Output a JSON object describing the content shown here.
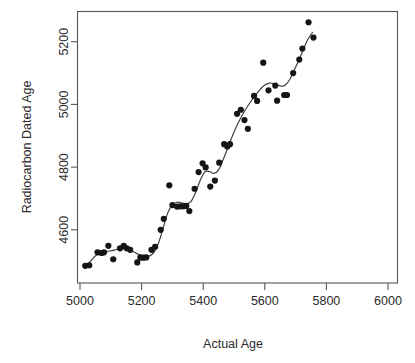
{
  "chart_data": {
    "type": "scatter",
    "title": "",
    "xlabel": "Actual Age",
    "ylabel": "Radiocarbon Dated Age",
    "xlim": [
      4995,
      6000
    ],
    "ylim": [
      4470,
      5285
    ],
    "grid": false,
    "legend": null,
    "xticks": [
      5000,
      5200,
      5400,
      5600,
      5800,
      6000
    ],
    "xticklabels": [
      "5000",
      "5200",
      "5400",
      "5600",
      "5800",
      "6000"
    ],
    "yticks": [
      4600,
      4800,
      5000,
      5200
    ],
    "yticklabels": [
      "4600",
      "4800",
      "5000",
      "5200"
    ],
    "marker": "filled-circle",
    "marker_color": "#151515",
    "curve_color": "#3a3a3a",
    "curve_label": "smoothed fit",
    "points": [
      {
        "x": 5017,
        "y": 4485
      },
      {
        "x": 5030,
        "y": 4487
      },
      {
        "x": 5057,
        "y": 4528
      },
      {
        "x": 5070,
        "y": 4526
      },
      {
        "x": 5078,
        "y": 4528
      },
      {
        "x": 5092,
        "y": 4549
      },
      {
        "x": 5108,
        "y": 4506
      },
      {
        "x": 5130,
        "y": 4541
      },
      {
        "x": 5142,
        "y": 4549
      },
      {
        "x": 5152,
        "y": 4541
      },
      {
        "x": 5163,
        "y": 4536
      },
      {
        "x": 5186,
        "y": 4496
      },
      {
        "x": 5196,
        "y": 4512
      },
      {
        "x": 5205,
        "y": 4511
      },
      {
        "x": 5215,
        "y": 4512
      },
      {
        "x": 5232,
        "y": 4536
      },
      {
        "x": 5244,
        "y": 4546
      },
      {
        "x": 5262,
        "y": 4600
      },
      {
        "x": 5272,
        "y": 4635
      },
      {
        "x": 5290,
        "y": 4742
      },
      {
        "x": 5300,
        "y": 4679
      },
      {
        "x": 5315,
        "y": 4674
      },
      {
        "x": 5325,
        "y": 4675
      },
      {
        "x": 5335,
        "y": 4675
      },
      {
        "x": 5345,
        "y": 4676
      },
      {
        "x": 5355,
        "y": 4660
      },
      {
        "x": 5372,
        "y": 4731
      },
      {
        "x": 5385,
        "y": 4784
      },
      {
        "x": 5398,
        "y": 4812
      },
      {
        "x": 5408,
        "y": 4799
      },
      {
        "x": 5423,
        "y": 4738
      },
      {
        "x": 5438,
        "y": 4757
      },
      {
        "x": 5452,
        "y": 4814
      },
      {
        "x": 5468,
        "y": 4873
      },
      {
        "x": 5478,
        "y": 4866
      },
      {
        "x": 5487,
        "y": 4873
      },
      {
        "x": 5510,
        "y": 4970
      },
      {
        "x": 5522,
        "y": 4983
      },
      {
        "x": 5534,
        "y": 4950
      },
      {
        "x": 5545,
        "y": 4922
      },
      {
        "x": 5565,
        "y": 5027
      },
      {
        "x": 5575,
        "y": 5011
      },
      {
        "x": 5595,
        "y": 5133
      },
      {
        "x": 5612,
        "y": 5045
      },
      {
        "x": 5634,
        "y": 5060
      },
      {
        "x": 5640,
        "y": 5012
      },
      {
        "x": 5663,
        "y": 5030
      },
      {
        "x": 5672,
        "y": 5030
      },
      {
        "x": 5692,
        "y": 5100
      },
      {
        "x": 5712,
        "y": 5143
      },
      {
        "x": 5722,
        "y": 5178
      },
      {
        "x": 5742,
        "y": 5262
      },
      {
        "x": 5758,
        "y": 5213
      }
    ],
    "curve_points": [
      {
        "x": 5017,
        "y": 4483
      },
      {
        "x": 5030,
        "y": 4495
      },
      {
        "x": 5045,
        "y": 4512
      },
      {
        "x": 5060,
        "y": 4524
      },
      {
        "x": 5080,
        "y": 4530
      },
      {
        "x": 5100,
        "y": 4533
      },
      {
        "x": 5125,
        "y": 4538
      },
      {
        "x": 5145,
        "y": 4539
      },
      {
        "x": 5165,
        "y": 4534
      },
      {
        "x": 5185,
        "y": 4524
      },
      {
        "x": 5205,
        "y": 4516
      },
      {
        "x": 5225,
        "y": 4516
      },
      {
        "x": 5240,
        "y": 4528
      },
      {
        "x": 5255,
        "y": 4558
      },
      {
        "x": 5270,
        "y": 4606
      },
      {
        "x": 5285,
        "y": 4654
      },
      {
        "x": 5300,
        "y": 4680
      },
      {
        "x": 5315,
        "y": 4688
      },
      {
        "x": 5330,
        "y": 4686
      },
      {
        "x": 5345,
        "y": 4683
      },
      {
        "x": 5360,
        "y": 4690
      },
      {
        "x": 5375,
        "y": 4718
      },
      {
        "x": 5390,
        "y": 4757
      },
      {
        "x": 5405,
        "y": 4784
      },
      {
        "x": 5420,
        "y": 4786
      },
      {
        "x": 5435,
        "y": 4780
      },
      {
        "x": 5450,
        "y": 4791
      },
      {
        "x": 5465,
        "y": 4824
      },
      {
        "x": 5480,
        "y": 4862
      },
      {
        "x": 5495,
        "y": 4900
      },
      {
        "x": 5515,
        "y": 4944
      },
      {
        "x": 5535,
        "y": 4980
      },
      {
        "x": 5555,
        "y": 5010
      },
      {
        "x": 5575,
        "y": 5036
      },
      {
        "x": 5595,
        "y": 5058
      },
      {
        "x": 5615,
        "y": 5068
      },
      {
        "x": 5635,
        "y": 5065
      },
      {
        "x": 5650,
        "y": 5059
      },
      {
        "x": 5665,
        "y": 5060
      },
      {
        "x": 5680,
        "y": 5078
      },
      {
        "x": 5695,
        "y": 5108
      },
      {
        "x": 5710,
        "y": 5140
      },
      {
        "x": 5725,
        "y": 5175
      },
      {
        "x": 5740,
        "y": 5208
      },
      {
        "x": 5755,
        "y": 5230
      }
    ]
  },
  "axes": {
    "x_axis_name": "x-axis",
    "y_axis_name": "y-axis"
  }
}
